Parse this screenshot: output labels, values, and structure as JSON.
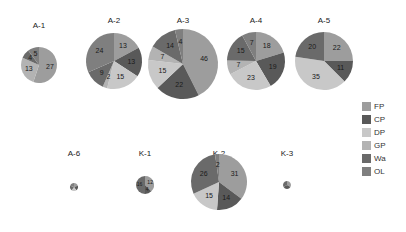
{
  "chart_data": {
    "type": "pie",
    "title": "",
    "legend": {
      "position": "right",
      "entries": [
        "FP",
        "CP",
        "DP",
        "GP",
        "Wa",
        "OL"
      ]
    },
    "colors": {
      "FP": "#9d9d9d",
      "CP": "#595959",
      "DP": "#c8c8c8",
      "GP": "#b3b3b3",
      "Wa": "#6a6a6a",
      "OL": "#7f7f7f"
    },
    "pies": [
      {
        "name": "A-1",
        "cx": 39,
        "cy": 65,
        "r": 18,
        "slices": [
          {
            "cat": "FP",
            "value": 27
          },
          {
            "cat": "CP",
            "value": 0
          },
          {
            "cat": "DP",
            "value": 0
          },
          {
            "cat": "GP",
            "value": 13
          },
          {
            "cat": "Wa",
            "value": 4
          },
          {
            "cat": "OL",
            "value": 5
          }
        ],
        "labels": [
          "27",
          "",
          "",
          "13",
          "4",
          "5"
        ]
      },
      {
        "name": "A-2",
        "cx": 114,
        "cy": 61,
        "r": 28,
        "slices": [
          {
            "cat": "FP",
            "value": 13
          },
          {
            "cat": "CP",
            "value": 13
          },
          {
            "cat": "DP",
            "value": 15
          },
          {
            "cat": "GP",
            "value": 2
          },
          {
            "cat": "Wa",
            "value": 9
          },
          {
            "cat": "OL",
            "value": 24
          }
        ],
        "labels": [
          "13",
          "13",
          "15",
          "2",
          "9",
          "24"
        ]
      },
      {
        "name": "A-3",
        "cx": 183,
        "cy": 64,
        "r": 35,
        "slices": [
          {
            "cat": "FP",
            "value": 46
          },
          {
            "cat": "CP",
            "value": 22
          },
          {
            "cat": "DP",
            "value": 15
          },
          {
            "cat": "GP",
            "value": 7
          },
          {
            "cat": "Wa",
            "value": 14
          },
          {
            "cat": "OL",
            "value": 4
          }
        ],
        "labels": [
          "46",
          "22",
          "15",
          "7",
          "14",
          "4"
        ]
      },
      {
        "name": "A-4",
        "cx": 256,
        "cy": 61,
        "r": 29,
        "slices": [
          {
            "cat": "FP",
            "value": 18
          },
          {
            "cat": "CP",
            "value": 19
          },
          {
            "cat": "DP",
            "value": 23
          },
          {
            "cat": "GP",
            "value": 7
          },
          {
            "cat": "Wa",
            "value": 15
          },
          {
            "cat": "OL",
            "value": 7
          }
        ],
        "labels": [
          "18",
          "19",
          "23",
          "7",
          "15",
          "7"
        ]
      },
      {
        "name": "A-5",
        "cx": 324,
        "cy": 61,
        "r": 29,
        "slices": [
          {
            "cat": "FP",
            "value": 22
          },
          {
            "cat": "CP",
            "value": 11
          },
          {
            "cat": "DP",
            "value": 35
          },
          {
            "cat": "GP",
            "value": 0
          },
          {
            "cat": "Wa",
            "value": 20
          },
          {
            "cat": "OL",
            "value": 0
          }
        ],
        "labels": [
          "22",
          "11",
          "35",
          "",
          "20",
          ""
        ]
      },
      {
        "name": "A-6",
        "cx": 74,
        "cy": 187,
        "r": 4,
        "slices": [
          {
            "cat": "FP",
            "value": 1
          },
          {
            "cat": "CP",
            "value": 1
          },
          {
            "cat": "DP",
            "value": 1
          },
          {
            "cat": "GP",
            "value": 0
          },
          {
            "cat": "Wa",
            "value": 1
          },
          {
            "cat": "OL",
            "value": 1
          }
        ],
        "labels": [
          "",
          "",
          "",
          "",
          "",
          ""
        ]
      },
      {
        "name": "K-1",
        "cx": 145,
        "cy": 185,
        "r": 9,
        "slices": [
          {
            "cat": "FP",
            "value": 12
          },
          {
            "cat": "CP",
            "value": 4
          },
          {
            "cat": "DP",
            "value": 0
          },
          {
            "cat": "GP",
            "value": 0
          },
          {
            "cat": "Wa",
            "value": 16
          },
          {
            "cat": "OL",
            "value": 0
          }
        ],
        "labels": [
          "12",
          "4",
          "",
          "",
          "16",
          ""
        ]
      },
      {
        "name": "K-2",
        "cx": 219,
        "cy": 182,
        "r": 28,
        "slices": [
          {
            "cat": "FP",
            "value": 31
          },
          {
            "cat": "CP",
            "value": 14
          },
          {
            "cat": "DP",
            "value": 15
          },
          {
            "cat": "GP",
            "value": 0
          },
          {
            "cat": "Wa",
            "value": 26
          },
          {
            "cat": "OL",
            "value": 2
          }
        ],
        "labels": [
          "31",
          "14",
          "15",
          "",
          "26",
          "2"
        ]
      },
      {
        "name": "K-3",
        "cx": 287,
        "cy": 185,
        "r": 4,
        "slices": [
          {
            "cat": "FP",
            "value": 1
          },
          {
            "cat": "CP",
            "value": 1
          },
          {
            "cat": "DP",
            "value": 0
          },
          {
            "cat": "GP",
            "value": 0
          },
          {
            "cat": "Wa",
            "value": 1
          },
          {
            "cat": "OL",
            "value": 0
          }
        ],
        "labels": [
          "",
          "",
          "",
          "",
          "",
          ""
        ]
      }
    ],
    "title_positions": {
      "A-1": [
        39,
        28
      ],
      "A-2": [
        114,
        23
      ],
      "A-3": [
        183,
        23
      ],
      "A-4": [
        256,
        23
      ],
      "A-5": [
        324,
        23
      ],
      "A-6": [
        74,
        156
      ],
      "K-1": [
        145,
        156
      ],
      "K-2": [
        219,
        156
      ],
      "K-3": [
        287,
        156
      ]
    }
  }
}
